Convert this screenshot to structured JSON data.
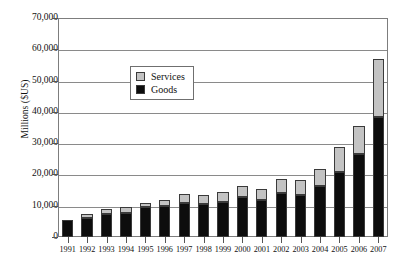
{
  "chart_data": {
    "type": "bar",
    "subtype": "stacked-vertical",
    "title": "",
    "xlabel": "",
    "ylabel": "Millions ($US)",
    "ylim": [
      0,
      70000
    ],
    "ytick_step": 10000,
    "ytick_labels": [
      "0",
      "10,000",
      "20,000",
      "30,000",
      "40,000",
      "50,000",
      "60,000",
      "70,000"
    ],
    "ytick_values": [
      0,
      10000,
      20000,
      30000,
      40000,
      50000,
      60000,
      70000
    ],
    "grid": "horizontal",
    "legend_position": "upper-center-left",
    "categories": [
      "1991",
      "1992",
      "1993",
      "1994",
      "1995",
      "1996",
      "1997",
      "1998",
      "1999",
      "2000",
      "2001",
      "2002",
      "2003",
      "2004",
      "2005",
      "2006",
      "2007"
    ],
    "series": [
      {
        "name": "Goods",
        "color": "#0d0d0d",
        "values": [
          5400,
          6200,
          7500,
          7800,
          9500,
          9800,
          11000,
          10500,
          11300,
          12900,
          11900,
          14200,
          13500,
          16300,
          20700,
          26400,
          38500
        ]
      },
      {
        "name": "Services",
        "color": "#c3c3c3",
        "values": [
          0,
          1300,
          1600,
          1800,
          1400,
          2100,
          2600,
          3000,
          3000,
          3500,
          3400,
          4400,
          4700,
          5600,
          8100,
          9200,
          18500
        ]
      }
    ],
    "totals": [
      5400,
      7500,
      9100,
      9600,
      10900,
      11900,
      13600,
      13500,
      14300,
      16400,
      15300,
      18600,
      18200,
      21900,
      28800,
      35600,
      57000
    ]
  },
  "legend": {
    "items": [
      {
        "label": "Services",
        "swatch": "#c3c3c3"
      },
      {
        "label": "Goods",
        "swatch": "#0d0d0d"
      }
    ]
  }
}
